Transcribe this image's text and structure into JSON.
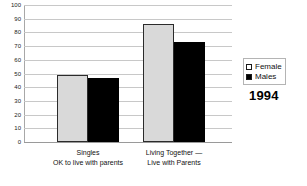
{
  "chart_data": {
    "type": "bar",
    "title": "",
    "xlabel": "",
    "ylabel": "",
    "ylim": [
      0,
      100
    ],
    "y_ticks": [
      0,
      10,
      20,
      30,
      40,
      50,
      60,
      70,
      80,
      90,
      100
    ],
    "grid": true,
    "legend_position": "right",
    "categories": [
      "Singles\nOK to live with parents",
      "Living Together —\nLive with Parents"
    ],
    "category_lines": [
      [
        "Singles",
        "OK to live with parents"
      ],
      [
        "Living Together —",
        "Live with Parents"
      ]
    ],
    "series": [
      {
        "name": "Female",
        "values": [
          49,
          86
        ],
        "color": "#d9d9d9"
      },
      {
        "name": "Males",
        "values": [
          47,
          73
        ],
        "color": "#000000"
      }
    ],
    "annotations": [
      "1994"
    ]
  },
  "legend": {
    "entries": [
      {
        "label": "Female",
        "swatch": "light-square-icon"
      },
      {
        "label": "Males",
        "swatch": "black-square-icon"
      }
    ]
  },
  "year": "1994",
  "caption": ""
}
